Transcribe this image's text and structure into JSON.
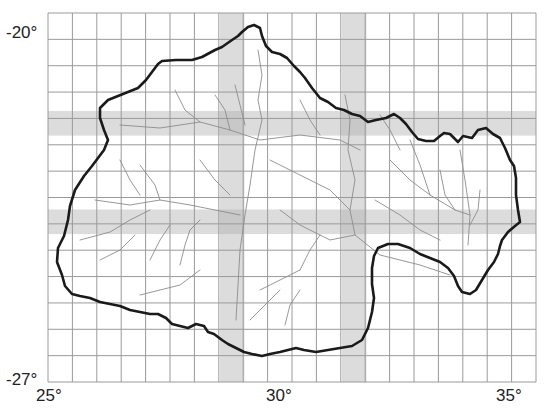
{
  "map": {
    "type": "grid-basin-map",
    "lon_range": [
      25,
      35
    ],
    "lat_range": [
      -27,
      -20
    ],
    "grid_step_deg": 0.5,
    "x_ticks": [
      {
        "value": 25,
        "label": "25°"
      },
      {
        "value": 30,
        "label": "30°"
      },
      {
        "value": 35,
        "label": "35°"
      }
    ],
    "y_ticks": [
      {
        "value": -20,
        "label": "-20°"
      },
      {
        "value": -27,
        "label": "-27°"
      }
    ],
    "highlighted_columns_lon": [
      [
        28.5,
        29.0
      ],
      [
        31.0,
        31.5
      ]
    ],
    "highlighted_rows_lat": [
      [
        -22.5,
        -22.0
      ],
      [
        -24.5,
        -24.0
      ]
    ],
    "colors": {
      "grid": "#9a9a9a",
      "band": "#dcdcdc",
      "band_overlap": "#c8c8c8",
      "boundary": "#1a1a1a",
      "rivers": "#8c8c8c"
    }
  }
}
